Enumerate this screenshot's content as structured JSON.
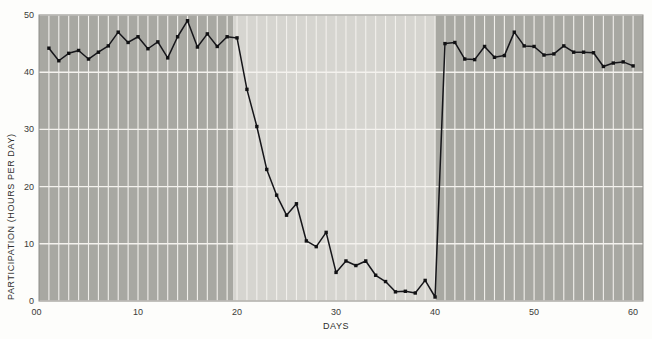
{
  "chart_data": {
    "type": "line",
    "title": "",
    "subtitle": "",
    "xlabel": "DAYS",
    "ylabel": "PARTICIPATION (HOURS PER DAY)",
    "xlim": [
      0,
      61
    ],
    "ylim": [
      0,
      50
    ],
    "xticks": [
      0,
      10,
      20,
      30,
      40,
      50,
      60
    ],
    "xtick_labels": [
      "0",
      "10",
      "20",
      "30",
      "40",
      "50",
      "60"
    ],
    "yticks": [
      0,
      10,
      20,
      30,
      40,
      50
    ],
    "ytick_labels": [
      "0",
      "10",
      "20",
      "30",
      "40",
      "50"
    ],
    "grid": true,
    "grid_orientation": "both",
    "legend": false,
    "legend_position": "none",
    "marker": "square",
    "line_color": "#16161a",
    "marker_color": "#121214",
    "shaded_phases": [
      {
        "name": "baseline",
        "x_start": 0,
        "x_end": 19.6,
        "color": "#a8a8a2"
      },
      {
        "name": "treatment",
        "x_start": 19.6,
        "x_end": 40.0,
        "color": "#d6d5d0"
      },
      {
        "name": "return-to-baseline",
        "x_start": 40.0,
        "x_end": 61,
        "color": "#a8a8a2"
      }
    ],
    "x": [
      1,
      2,
      3,
      4,
      5,
      6,
      7,
      8,
      9,
      10,
      11,
      12,
      13,
      14,
      15,
      16,
      17,
      18,
      19,
      20,
      21,
      22,
      23,
      24,
      25,
      26,
      27,
      28,
      29,
      30,
      31,
      32,
      33,
      34,
      35,
      36,
      37,
      38,
      39,
      40,
      41,
      42,
      43,
      44,
      45,
      46,
      47,
      48,
      49,
      50,
      51,
      52,
      53,
      54,
      55,
      56,
      57,
      58,
      59,
      60
    ],
    "series": [
      {
        "name": "Participation",
        "values": [
          44.2,
          42.0,
          43.3,
          43.8,
          42.3,
          43.5,
          44.6,
          47.0,
          45.2,
          46.2,
          44.1,
          45.3,
          42.5,
          46.2,
          49.0,
          44.4,
          46.7,
          44.5,
          46.2,
          46.0,
          37.0,
          30.5,
          23.0,
          18.5,
          15.0,
          17.0,
          10.5,
          9.5,
          12.0,
          5.0,
          7.0,
          6.2,
          7.0,
          4.5,
          3.4,
          1.6,
          1.7,
          1.4,
          3.6,
          0.7,
          45.0,
          45.2,
          42.3,
          42.2,
          44.5,
          42.6,
          42.9,
          47.0,
          44.6,
          44.5,
          43.0,
          43.2,
          44.6,
          43.5,
          43.5,
          43.4,
          41.0,
          41.6,
          41.8,
          41.1
        ]
      }
    ]
  },
  "axes": {
    "y_axis_title": "PARTICIPATION (HOURS PER DAY)",
    "x_axis_title": "DAYS"
  }
}
